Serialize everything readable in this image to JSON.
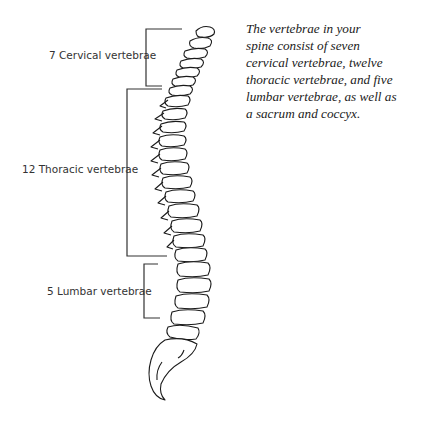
{
  "diagram": {
    "labels": [
      {
        "id": "cervical",
        "text": "7 Cervical vertebrae",
        "count": 7
      },
      {
        "id": "thoracic",
        "text": "12 Thoracic vertebrae",
        "count": 12
      },
      {
        "id": "lumbar",
        "text": "5 Lumbar vertebrae",
        "count": 5
      }
    ],
    "caption_lines": [
      "The vertebrae in your",
      "spine consist of seven",
      "cervical vertebrae, twelve",
      "thoracic vertebrae, and five",
      "lumbar vertebrae, as well as",
      "a sacrum and coccyx."
    ],
    "colors": {
      "line": "#1a1a1a",
      "bracket": "#333333",
      "text": "#333333",
      "background": "#ffffff"
    }
  }
}
